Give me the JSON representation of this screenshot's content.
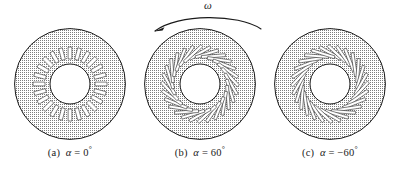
{
  "figure": {
    "background_color": "#ffffff",
    "line_color": "#1a1a1a",
    "stipple_color": "#8a8a8a"
  },
  "rotation_indicator": {
    "symbol": "ω",
    "name": "omega",
    "direction": "counterclockwise",
    "arrowhead_at": "left"
  },
  "panels": [
    {
      "id": "a",
      "caption_index": "(a)",
      "variable": "α",
      "equals": "=",
      "value": "0",
      "degree": "°",
      "caption_full": "(a)  α = 0°",
      "angle_deg": 0,
      "slot_count": 24,
      "slot_shape": "radial-rectangular"
    },
    {
      "id": "b",
      "caption_index": "(b)",
      "variable": "α",
      "equals": "=",
      "value": "60",
      "degree": "°",
      "caption_full": "(b)  α = 60°",
      "angle_deg": 60,
      "slot_count": 28,
      "slot_shape": "slanted-rectangular"
    },
    {
      "id": "c",
      "caption_index": "(c)",
      "variable": "α",
      "equals": "=",
      "value": "−60",
      "degree": "°",
      "caption_full": "(c)  α = −60°",
      "angle_deg": -60,
      "slot_count": 28,
      "slot_shape": "slanted-rectangular"
    }
  ],
  "geometry": {
    "outer_radius": 56,
    "slot_ring_outer_radius": 37,
    "slot_ring_inner_radius": 25,
    "hub_radius": 20
  }
}
